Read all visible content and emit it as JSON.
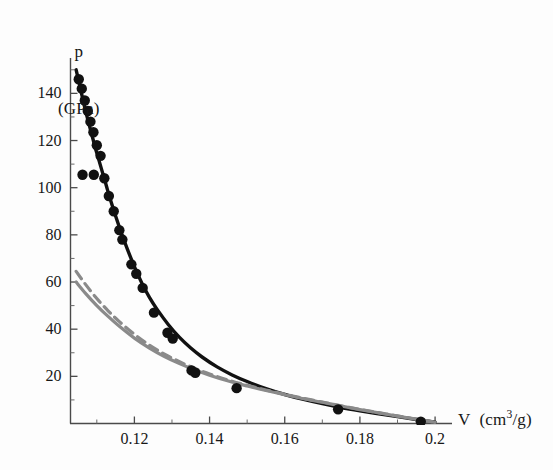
{
  "figure": {
    "background_color": "#fdfdfd",
    "curve_color": "#111111",
    "band_color": "#8a8a8a",
    "marker_color": "#111111"
  },
  "chart_data": {
    "type": "line",
    "title": "",
    "subtitle": "",
    "xlabel": "V (cm3/g)",
    "xlabel_parts": {
      "symbol": "V",
      "units_pre": "(cm",
      "units_sup": "3",
      "units_post": "/g)"
    },
    "ylabel": "p (GPa)",
    "ylabel_lines": [
      "p",
      "(GPa)"
    ],
    "xlim": [
      0.103,
      0.2045
    ],
    "ylim": [
      0,
      155
    ],
    "grid": false,
    "legend_position": "none",
    "x_ticks": [
      0.12,
      0.14,
      0.16,
      0.18,
      0.2
    ],
    "x_tick_labels": [
      "0.12",
      "0.14",
      "0.16",
      "0.18",
      "0.2"
    ],
    "x_minor_ticks": [
      0.11,
      0.13,
      0.15,
      0.17,
      0.19
    ],
    "y_ticks": [
      20,
      40,
      60,
      80,
      100,
      120,
      140
    ],
    "y_tick_labels": [
      "20",
      "40",
      "60",
      "80",
      "100",
      "120",
      "140"
    ],
    "y_minor_ticks": [
      10,
      30,
      50,
      70,
      90,
      110,
      130,
      150
    ],
    "series": [
      {
        "name": "Hugoniot fit curve",
        "style": "solid",
        "color": "#111111",
        "width": 3.4,
        "x": [
          0.1045,
          0.1055,
          0.1065,
          0.1075,
          0.1085,
          0.1095,
          0.1105,
          0.1115,
          0.1125,
          0.1135,
          0.115,
          0.1165,
          0.118,
          0.12,
          0.122,
          0.124,
          0.126,
          0.129,
          0.132,
          0.135,
          0.138,
          0.142,
          0.146,
          0.15,
          0.155,
          0.16,
          0.165,
          0.17,
          0.175,
          0.18,
          0.185,
          0.19,
          0.195,
          0.2
        ],
        "y": [
          150.0,
          143.0,
          136.0,
          129.5,
          123.5,
          117.5,
          112.0,
          106.5,
          101.0,
          95.5,
          88.0,
          81.0,
          74.5,
          66.5,
          59.5,
          53.5,
          48.5,
          42.0,
          36.5,
          32.0,
          28.2,
          24.0,
          20.6,
          17.8,
          14.8,
          12.3,
          10.2,
          8.4,
          6.8,
          5.4,
          4.1,
          2.9,
          1.7,
          0.6
        ]
      },
      {
        "name": "Reference curve (dashed)",
        "style": "dashed",
        "color": "#8a8a8a",
        "width": 3.2,
        "x": [
          0.1045,
          0.107,
          0.11,
          0.113,
          0.116,
          0.12,
          0.124,
          0.128,
          0.132,
          0.136,
          0.14,
          0.145,
          0.15,
          0.155,
          0.16,
          0.165,
          0.17,
          0.175,
          0.18,
          0.185,
          0.19,
          0.195,
          0.2
        ],
        "y": [
          64.5,
          59.0,
          53.0,
          47.8,
          43.2,
          37.8,
          33.2,
          29.4,
          26.2,
          23.4,
          21.0,
          18.4,
          16.2,
          14.2,
          12.4,
          10.7,
          9.1,
          7.5,
          6.0,
          4.6,
          3.2,
          1.9,
          0.6
        ]
      },
      {
        "name": "Reference curve (solid)",
        "style": "solid",
        "color": "#8a8a8a",
        "width": 3.2,
        "x": [
          0.1045,
          0.107,
          0.11,
          0.113,
          0.116,
          0.12,
          0.124,
          0.128,
          0.132,
          0.136,
          0.14,
          0.145,
          0.15,
          0.155,
          0.16,
          0.165,
          0.17,
          0.175,
          0.18,
          0.185,
          0.19,
          0.195,
          0.2
        ],
        "y": [
          60.0,
          55.2,
          50.0,
          45.4,
          41.2,
          36.2,
          32.0,
          28.4,
          25.4,
          22.8,
          20.5,
          18.0,
          15.9,
          14.0,
          12.2,
          10.5,
          9.0,
          7.4,
          5.9,
          4.5,
          3.1,
          1.8,
          0.5
        ]
      }
    ],
    "scatter": {
      "name": "Experimental data points",
      "marker": "filled-circle",
      "color": "#111111",
      "points": [
        {
          "x": 0.1052,
          "y": 146.0
        },
        {
          "x": 0.106,
          "y": 142.0
        },
        {
          "x": 0.1068,
          "y": 137.0
        },
        {
          "x": 0.1076,
          "y": 132.5
        },
        {
          "x": 0.1083,
          "y": 128.0
        },
        {
          "x": 0.1091,
          "y": 123.5
        },
        {
          "x": 0.11,
          "y": 118.0
        },
        {
          "x": 0.111,
          "y": 113.5
        },
        {
          "x": 0.1062,
          "y": 105.5
        },
        {
          "x": 0.1092,
          "y": 105.5
        },
        {
          "x": 0.112,
          "y": 104.0
        },
        {
          "x": 0.1132,
          "y": 96.5
        },
        {
          "x": 0.1145,
          "y": 90.0
        },
        {
          "x": 0.116,
          "y": 82.0
        },
        {
          "x": 0.1168,
          "y": 78.0
        },
        {
          "x": 0.1192,
          "y": 67.5
        },
        {
          "x": 0.1205,
          "y": 63.5
        },
        {
          "x": 0.1222,
          "y": 57.5
        },
        {
          "x": 0.1252,
          "y": 47.0
        },
        {
          "x": 0.1288,
          "y": 38.5
        },
        {
          "x": 0.1302,
          "y": 36.0
        },
        {
          "x": 0.1352,
          "y": 22.5
        },
        {
          "x": 0.1362,
          "y": 21.5
        },
        {
          "x": 0.1472,
          "y": 15.0
        },
        {
          "x": 0.1742,
          "y": 6.0
        },
        {
          "x": 0.1962,
          "y": 0.8
        }
      ]
    },
    "annotations": []
  }
}
